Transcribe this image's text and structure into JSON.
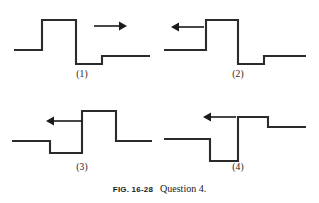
{
  "figure": {
    "caption_fignum": "FIG. 16-28",
    "caption_text": "Question 4.",
    "stroke_color": "#2b2b2b",
    "arrow_color": "#1a1a1a",
    "background_color": "#ffffff"
  },
  "panels": [
    {
      "id": "panel-1",
      "label": "(1)",
      "arrow_direction": "right",
      "arrow_icon": "arrow-right-icon",
      "description": "Pulse with tall upward peak followed by deep downward dip and a small upward step",
      "baseline_y": 44,
      "levels": {
        "baseline": 44,
        "peak": 14,
        "dip": 58,
        "step": 50
      },
      "points": "8,44 36,44 36,14 70,14 70,58 96,58 96,50 144,50",
      "arrow": {
        "x1": 88,
        "y1": 20,
        "x2": 116,
        "y2": 20
      }
    },
    {
      "id": "panel-2",
      "label": "(2)",
      "arrow_direction": "left",
      "arrow_icon": "arrow-left-icon",
      "description": "Same pulse as panel 1 with tall upward peak then deep downward dip and small upward step",
      "baseline_y": 44,
      "levels": {
        "baseline": 44,
        "peak": 14,
        "dip": 58,
        "step": 50
      },
      "points": "2,44 44,44 44,14 76,14 76,58 102,58 102,50 144,50",
      "arrow": {
        "x1": 40,
        "y1": 21,
        "x2": 12,
        "y2": 21
      }
    },
    {
      "id": "panel-3",
      "label": "(3)",
      "arrow_direction": "left",
      "arrow_icon": "arrow-left-icon",
      "description": "Pulse with small downward dip followed by tall upward peak then baseline",
      "baseline_y": 42,
      "levels": {
        "baseline": 42,
        "dip": 54,
        "peak": 12,
        "tail": 42
      },
      "points": "6,42 44,42 44,54 76,54 76,12 110,12 110,42 146,42",
      "arrow": {
        "x1": 74,
        "y1": 22,
        "x2": 40,
        "y2": 22
      }
    },
    {
      "id": "panel-4",
      "label": "(4)",
      "arrow_direction": "left",
      "arrow_icon": "arrow-left-icon",
      "description": "Pulse with deep downward dip followed by tall upward peak and a small downward step",
      "baseline_y": 40,
      "levels": {
        "baseline": 40,
        "dip": 62,
        "peak": 18,
        "step": 28
      },
      "points": "2,40 48,40 48,62 76,62 76,18 106,18 106,28 144,28",
      "arrow": {
        "x1": 74,
        "y1": 18,
        "x2": 42,
        "y2": 18
      }
    }
  ]
}
